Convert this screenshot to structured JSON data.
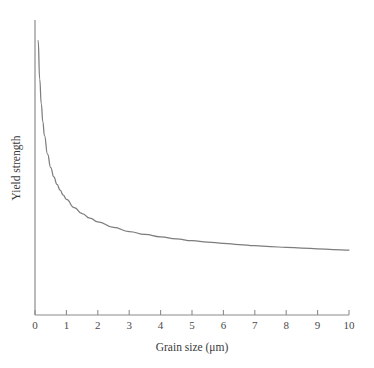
{
  "chart_data": {
    "type": "line",
    "title": "",
    "xlabel": "Grain size (μm)",
    "ylabel": "Yield strength",
    "xlim": [
      0,
      10
    ],
    "ylim": [
      0,
      1
    ],
    "grid": false,
    "legend": null,
    "xticks": [
      "0",
      "1",
      "2",
      "3",
      "4",
      "5",
      "6",
      "7",
      "8",
      "9",
      "10"
    ],
    "xtick_values": [
      0,
      1,
      2,
      3,
      4,
      5,
      6,
      7,
      8,
      9,
      10
    ],
    "yticks": [],
    "series": [
      {
        "name": "Hall-Petch yield strength",
        "x": [
          0.1,
          0.15,
          0.2,
          0.25,
          0.3,
          0.4,
          0.5,
          0.6,
          0.7,
          0.8,
          0.9,
          1.0,
          1.25,
          1.5,
          1.75,
          2.0,
          2.5,
          3.0,
          3.5,
          4.0,
          4.5,
          5.0,
          5.5,
          6.0,
          6.5,
          7.0,
          7.5,
          8.0,
          8.5,
          9.0,
          9.5,
          10.0
        ],
        "y": [
          0.93,
          0.8,
          0.716,
          0.655,
          0.609,
          0.545,
          0.5,
          0.468,
          0.443,
          0.423,
          0.406,
          0.392,
          0.364,
          0.344,
          0.328,
          0.316,
          0.297,
          0.283,
          0.273,
          0.265,
          0.258,
          0.252,
          0.247,
          0.243,
          0.239,
          0.235,
          0.232,
          0.229,
          0.227,
          0.224,
          0.222,
          0.22
        ]
      }
    ]
  },
  "style": {
    "axis_color": "#8c8c8c",
    "curve_color": "#7d7d7d",
    "text_color": "#3a3a3a",
    "background": "#ffffff"
  }
}
